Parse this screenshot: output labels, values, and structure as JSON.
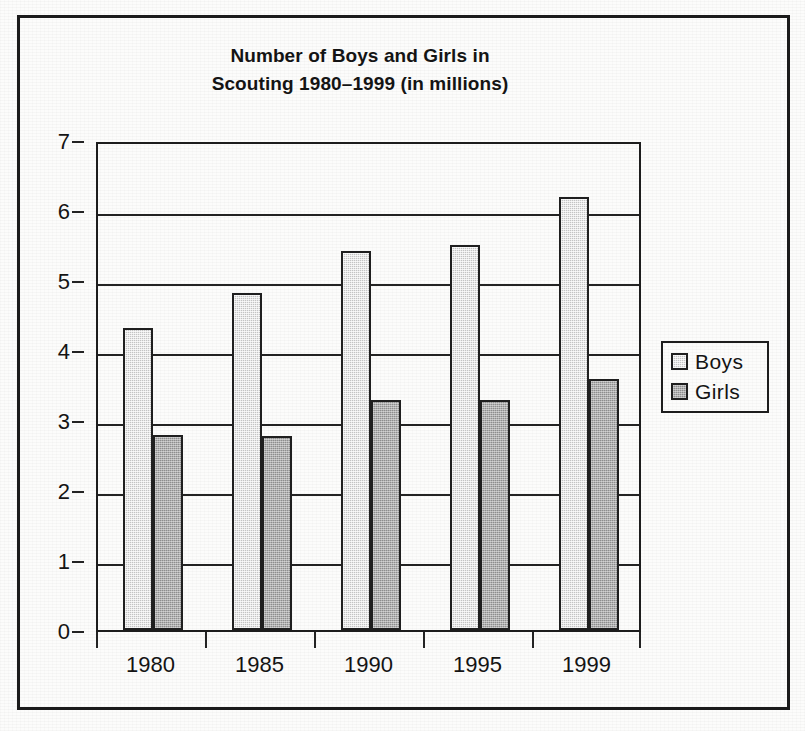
{
  "chart_data": {
    "type": "bar",
    "title": "Number of Boys and Girls in Scouting 1980–1999 (in millions)",
    "title_lines": [
      "Number of Boys and Girls in",
      "Scouting 1980–1999 (in millions)"
    ],
    "categories": [
      "1980",
      "1985",
      "1990",
      "1995",
      "1999"
    ],
    "series": [
      {
        "name": "Boys",
        "values": [
          4.32,
          4.81,
          5.41,
          5.5,
          6.18
        ],
        "color": "#c3c3c3"
      },
      {
        "name": "Girls",
        "values": [
          2.78,
          2.77,
          3.29,
          3.28,
          3.58
        ],
        "color": "#8d8d8d"
      }
    ],
    "xlabel": "",
    "ylabel": "",
    "ylim": [
      0,
      7
    ],
    "ytick_labels": [
      "0",
      "1",
      "2",
      "3",
      "4",
      "5",
      "6",
      "7"
    ],
    "ytick_values": [
      0,
      1,
      2,
      3,
      4,
      5,
      6,
      7
    ],
    "grid": true,
    "legend_position": "right",
    "frame": true,
    "units": "millions"
  },
  "legend": {
    "entries": [
      {
        "label": "Boys"
      },
      {
        "label": "Girls"
      }
    ]
  },
  "colors": {
    "boys": "#c3c3c3",
    "girls": "#8d8d8d",
    "ink": "#141414",
    "axis": "#232323",
    "paper": "#fcfcfb"
  }
}
